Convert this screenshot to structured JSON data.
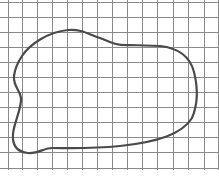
{
  "figure": {
    "grid": {
      "color": "#8a8a8a",
      "line_width": 1,
      "vertical_x": [
        8,
        22,
        37,
        52,
        67,
        82,
        97,
        112,
        127,
        142,
        157,
        173,
        188,
        204,
        218
      ],
      "horizontal_y": [
        2,
        17,
        32,
        47,
        62,
        77,
        92,
        107,
        122,
        137,
        152,
        168
      ],
      "top": 0,
      "bottom": 170
    },
    "shape": {
      "stroke": "#4a4a4a",
      "stroke_width": 2.2,
      "path": "M 22 56 C 30 44, 48 32, 68 30 C 82 29, 88 34, 100 38 C 112 43, 118 46, 130 45 L 160 46 C 178 48, 190 56, 194 72 C 198 88, 198 104, 192 118 C 182 134, 158 142, 120 146 C 90 149, 70 148, 52 148 C 44 148, 38 154, 28 153 C 18 152, 12 146, 13 134 C 14 122, 22 108, 21 98 C 20 90, 13 86, 14 76 C 15 68, 18 62, 22 56 Z"
    }
  }
}
